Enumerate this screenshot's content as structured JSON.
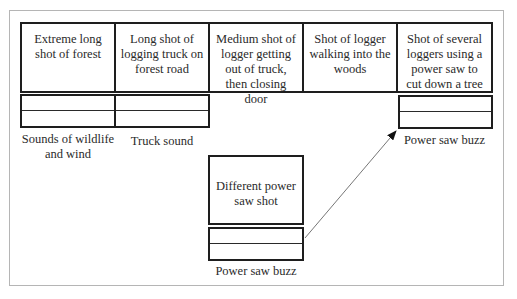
{
  "diagram": {
    "type": "storyboard-audio-layout",
    "shots": [
      {
        "text": "Extreme long shot of forest",
        "audio_label": "Sounds of wildlife and wind",
        "has_audio_track": true
      },
      {
        "text": "Long shot of logging truck on forest road",
        "audio_label": "Truck sound",
        "has_audio_track": true
      },
      {
        "text": "Medium shot of logger getting out of truck, then closing door",
        "audio_label": "",
        "has_audio_track": false
      },
      {
        "text": "Shot of logger walking into the woods",
        "audio_label": "",
        "has_audio_track": false
      },
      {
        "text": "Shot of several loggers using a power saw to cut down a tree",
        "audio_label": "Power saw buzz",
        "has_audio_track": true
      }
    ],
    "inserted_shot": {
      "text": "Different power saw shot",
      "audio_label": "Power saw buzz",
      "arrow_to_shot_index": 4
    },
    "colors": {
      "box_border": "#1e1e1e",
      "frame_border": "#b5b5b5",
      "arrow": "#555555",
      "text": "#2a2a2a"
    }
  }
}
